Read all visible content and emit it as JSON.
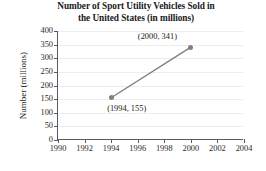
{
  "chart_data": {
    "type": "line",
    "title": "Number of Sport Utility Vehicles Sold in the United States (in millions)",
    "title_line1": "Number of Sport Utility Vehicles Sold in",
    "title_line2": "the United States (in millions)",
    "xlabel": "",
    "ylabel": "Number (millions)",
    "xlim": [
      1990,
      2004
    ],
    "ylim": [
      0,
      400
    ],
    "xticks": [
      1990,
      1992,
      1994,
      1996,
      1998,
      2000,
      2002,
      2004
    ],
    "yticks": [
      0,
      50,
      100,
      150,
      200,
      250,
      300,
      350,
      400
    ],
    "grid": true,
    "legend": "none",
    "series": [
      {
        "name": "SUVs sold",
        "color": "#808080",
        "marker": "circle",
        "x": [
          1994,
          2000
        ],
        "values": [
          155,
          341
        ]
      }
    ],
    "annotations": [
      {
        "text": "(1994, 155)",
        "x": 1994,
        "y": 155,
        "position": "below-right"
      },
      {
        "text": "(2000, 341)",
        "x": 2000,
        "y": 341,
        "position": "above-left"
      }
    ]
  },
  "colors": {
    "series": "#808080",
    "axis": "#5a5a5a",
    "grid": "#ededed",
    "text": "#1a1a1a",
    "background": "#ffffff"
  }
}
